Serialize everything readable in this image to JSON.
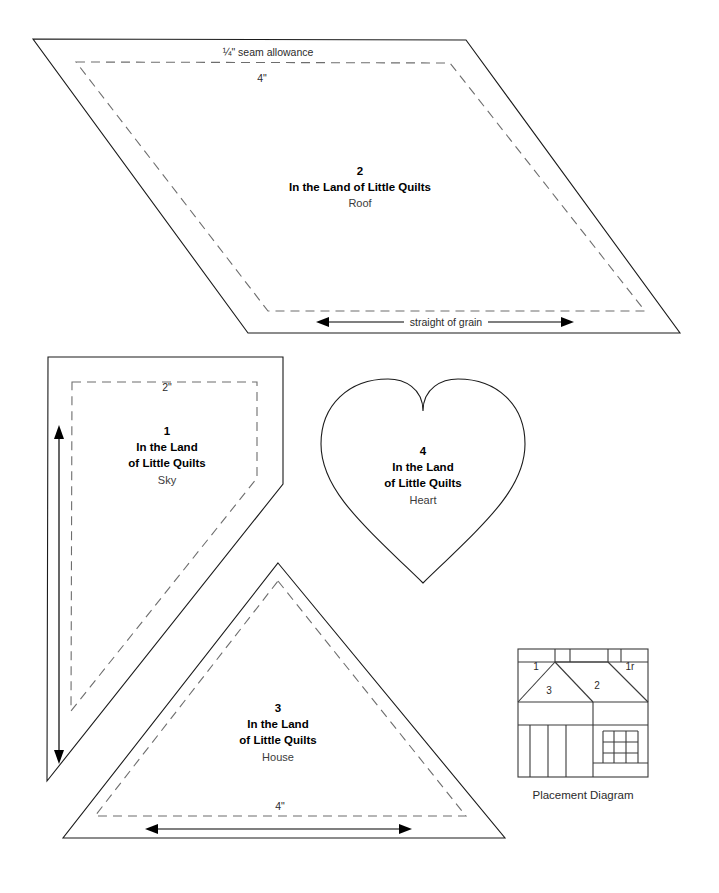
{
  "sheet": {
    "kind": "quilt-pattern-template-sheet",
    "background_color": "#ffffff",
    "cut_line_color": "#1b1b1b",
    "seam_line_color": "#6d6d6d"
  },
  "notes": {
    "seam_allowance": "¼\" seam allowance",
    "straight_of_grain": "straight of grain"
  },
  "pieces": [
    {
      "id": "roof",
      "number": "2",
      "title": "In the Land of Little Quilts",
      "part": "Roof",
      "shape": "parallelogram",
      "dimension_label": "4\"",
      "grain_label": "straight of grain",
      "grain_direction": "horizontal"
    },
    {
      "id": "sky",
      "number": "1",
      "title_line1": "In the Land",
      "title_line2": "of Little Quilts",
      "part": "Sky",
      "shape": "pentagon",
      "dimension_label": "2\"",
      "grain_direction": "vertical"
    },
    {
      "id": "heart",
      "number": "4",
      "title_line1": "In the Land",
      "title_line2": "of Little Quilts",
      "part": "Heart",
      "shape": "heart"
    },
    {
      "id": "house",
      "number": "3",
      "title_line1": "In the Land",
      "title_line2": "of Little Quilts",
      "part": "House",
      "shape": "triangle",
      "dimension_label": "4\"",
      "grain_direction": "horizontal"
    }
  ],
  "placement_diagram": {
    "caption": "Placement Diagram",
    "labels": [
      {
        "text": "1",
        "x": 536,
        "y": 667
      },
      {
        "text": "1r",
        "x": 630,
        "y": 667
      },
      {
        "text": "3",
        "x": 549,
        "y": 690
      },
      {
        "text": "2",
        "x": 595,
        "y": 685
      }
    ]
  }
}
